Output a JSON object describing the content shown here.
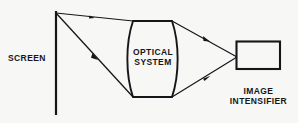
{
  "figure": {
    "type": "optical-ray-diagram",
    "background_color": "#f7f7f5",
    "stroke_color": "#16161a",
    "text_color": "#16161a"
  },
  "labels": {
    "screen": "SCREEN",
    "optical_system_line1": "OPTICAL",
    "optical_system_line2": "SYSTEM",
    "image_intensifier_line1": "IMAGE",
    "image_intensifier_line2": "INTENSIFIER"
  },
  "components": {
    "screen": {
      "name": "SCREEN",
      "shape": "vertical-line",
      "x": 56,
      "y_top": 11,
      "y_bottom": 115
    },
    "optical_system": {
      "name": "OPTICAL SYSTEM",
      "shape": "biconvex-lens",
      "left": 133,
      "right": 172,
      "top": 21,
      "bottom": 97
    },
    "image_intensifier": {
      "name": "IMAGE INTENSIFIER",
      "shape": "rectangle",
      "left": 236,
      "right": 280,
      "top": 41,
      "bottom": 69
    }
  },
  "rays": [
    {
      "name": "upper-incoming-ray",
      "from": "screen-top",
      "to": "lens-top-left",
      "x1": 56,
      "y1": 13,
      "x2": 133,
      "y2": 21,
      "arrow_at": 0.48
    },
    {
      "name": "lower-incoming-ray",
      "from": "screen-top",
      "to": "lens-bottom-left",
      "x1": 56,
      "y1": 13,
      "x2": 133,
      "y2": 97,
      "arrow_at": 0.52
    },
    {
      "name": "upper-outgoing-ray",
      "from": "lens-top-right",
      "to": "intensifier-focus",
      "x1": 172,
      "y1": 21,
      "x2": 237,
      "y2": 57,
      "arrow_at": 0.55
    },
    {
      "name": "lower-outgoing-ray",
      "from": "lens-bottom-right",
      "to": "intensifier-focus",
      "x1": 172,
      "y1": 97,
      "x2": 237,
      "y2": 57,
      "arrow_at": 0.58
    }
  ]
}
